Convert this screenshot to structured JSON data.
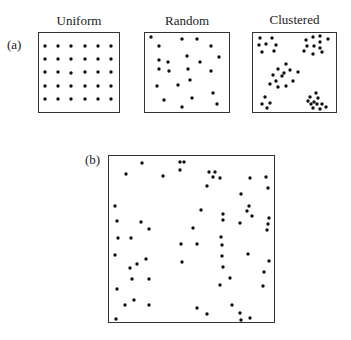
{
  "figure": {
    "panel_a": {
      "label": "(a)",
      "panels": [
        {
          "title": "Uniform",
          "box": [
            38,
            32,
            82,
            81
          ]
        },
        {
          "title": "Random",
          "box": [
            144,
            32,
            86,
            81
          ]
        },
        {
          "title": "Clustered",
          "box": [
            252,
            32,
            85,
            81
          ]
        }
      ]
    },
    "panel_b": {
      "label": "(b)",
      "box": [
        108,
        155,
        167,
        168
      ]
    },
    "dot_color": "#111111",
    "dot_radius": 1.7
  },
  "dots": {
    "uniform": [
      [
        45,
        46
      ],
      [
        58,
        46
      ],
      [
        71,
        46
      ],
      [
        85,
        46
      ],
      [
        98,
        46
      ],
      [
        111,
        46
      ],
      [
        45,
        59
      ],
      [
        58,
        59
      ],
      [
        71,
        59
      ],
      [
        85,
        59
      ],
      [
        98,
        59
      ],
      [
        111,
        59
      ],
      [
        45,
        72
      ],
      [
        58,
        72
      ],
      [
        71,
        73
      ],
      [
        85,
        72
      ],
      [
        98,
        72
      ],
      [
        111,
        72
      ],
      [
        45,
        86
      ],
      [
        58,
        86
      ],
      [
        71,
        86
      ],
      [
        85,
        86
      ],
      [
        98,
        86
      ],
      [
        111,
        86
      ],
      [
        45,
        99
      ],
      [
        58,
        99
      ],
      [
        71,
        99
      ],
      [
        85,
        99
      ],
      [
        98,
        99
      ],
      [
        111,
        99
      ]
    ],
    "random": [
      [
        151,
        37
      ],
      [
        159,
        46
      ],
      [
        182,
        39
      ],
      [
        197,
        39
      ],
      [
        211,
        46
      ],
      [
        159,
        60
      ],
      [
        168,
        62
      ],
      [
        187,
        56
      ],
      [
        200,
        62
      ],
      [
        219,
        57
      ],
      [
        159,
        69
      ],
      [
        169,
        71
      ],
      [
        188,
        69
      ],
      [
        211,
        71
      ],
      [
        190,
        80
      ],
      [
        157,
        86
      ],
      [
        178,
        85
      ],
      [
        213,
        93
      ],
      [
        164,
        100
      ],
      [
        192,
        98
      ],
      [
        217,
        104
      ],
      [
        182,
        107
      ]
    ],
    "clustered": [
      [
        260,
        38
      ],
      [
        272,
        38
      ],
      [
        259,
        45
      ],
      [
        266,
        44
      ],
      [
        276,
        45
      ],
      [
        262,
        52
      ],
      [
        274,
        51
      ],
      [
        306,
        40
      ],
      [
        313,
        37
      ],
      [
        320,
        36
      ],
      [
        328,
        39
      ],
      [
        320,
        42
      ],
      [
        307,
        46
      ],
      [
        314,
        46
      ],
      [
        320,
        48
      ],
      [
        304,
        51
      ],
      [
        313,
        54
      ],
      [
        322,
        52
      ],
      [
        286,
        64
      ],
      [
        278,
        69
      ],
      [
        284,
        73
      ],
      [
        290,
        70
      ],
      [
        298,
        72
      ],
      [
        273,
        75
      ],
      [
        282,
        76
      ],
      [
        276,
        81
      ],
      [
        293,
        81
      ],
      [
        270,
        84
      ],
      [
        286,
        86
      ],
      [
        278,
        87
      ],
      [
        265,
        97
      ],
      [
        262,
        104
      ],
      [
        270,
        103
      ],
      [
        267,
        108
      ],
      [
        316,
        93
      ],
      [
        310,
        97
      ],
      [
        318,
        98
      ],
      [
        314,
        102
      ],
      [
        308,
        101
      ],
      [
        317,
        104
      ],
      [
        311,
        104
      ],
      [
        322,
        104
      ],
      [
        313,
        108
      ],
      [
        320,
        109
      ],
      [
        326,
        107
      ]
    ],
    "panel_b": [
      [
        142,
        163
      ],
      [
        126,
        174
      ],
      [
        163,
        176
      ],
      [
        180,
        162
      ],
      [
        184,
        162
      ],
      [
        180,
        170
      ],
      [
        209,
        172
      ],
      [
        215,
        172
      ],
      [
        213,
        177
      ],
      [
        220,
        178
      ],
      [
        207,
        186
      ],
      [
        250,
        178
      ],
      [
        266,
        177
      ],
      [
        268,
        188
      ],
      [
        241,
        194
      ],
      [
        115,
        206
      ],
      [
        117,
        221
      ],
      [
        141,
        222
      ],
      [
        149,
        229
      ],
      [
        193,
        228
      ],
      [
        118,
        238
      ],
      [
        131,
        238
      ],
      [
        249,
        206
      ],
      [
        247,
        211
      ],
      [
        252,
        216
      ],
      [
        201,
        210
      ],
      [
        223,
        214
      ],
      [
        223,
        220
      ],
      [
        240,
        223
      ],
      [
        269,
        218
      ],
      [
        268,
        224
      ],
      [
        267,
        230
      ],
      [
        221,
        237
      ],
      [
        181,
        244
      ],
      [
        197,
        244
      ],
      [
        222,
        245
      ],
      [
        248,
        254
      ],
      [
        222,
        256
      ],
      [
        115,
        255
      ],
      [
        146,
        259
      ],
      [
        137,
        264
      ],
      [
        130,
        268
      ],
      [
        269,
        261
      ],
      [
        182,
        262
      ],
      [
        223,
        267
      ],
      [
        264,
        272
      ],
      [
        132,
        279
      ],
      [
        149,
        279
      ],
      [
        230,
        278
      ],
      [
        220,
        285
      ],
      [
        263,
        286
      ],
      [
        117,
        289
      ],
      [
        134,
        300
      ],
      [
        125,
        305
      ],
      [
        149,
        305
      ],
      [
        116,
        319
      ],
      [
        197,
        308
      ],
      [
        207,
        314
      ],
      [
        232,
        305
      ],
      [
        240,
        313
      ],
      [
        241,
        320
      ],
      [
        250,
        318
      ]
    ]
  }
}
